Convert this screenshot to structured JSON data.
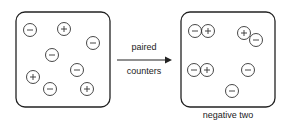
{
  "diagram": {
    "arrow": {
      "label_top": "paired",
      "label_bottom": "counters"
    },
    "left_box": {
      "counters": [
        {
          "sign": "-",
          "x": 30,
          "y": 30
        },
        {
          "sign": "+",
          "x": 64,
          "y": 29
        },
        {
          "sign": "-",
          "x": 93,
          "y": 43
        },
        {
          "sign": "-",
          "x": 52,
          "y": 55
        },
        {
          "sign": "-",
          "x": 77,
          "y": 70
        },
        {
          "sign": "+",
          "x": 33,
          "y": 77
        },
        {
          "sign": "-",
          "x": 50,
          "y": 89
        },
        {
          "sign": "+",
          "x": 87,
          "y": 89
        }
      ]
    },
    "right_box": {
      "caption": "negative two",
      "counters": [
        {
          "sign": "-",
          "x": 195,
          "y": 31
        },
        {
          "sign": "+",
          "x": 208,
          "y": 31
        },
        {
          "sign": "+",
          "x": 244,
          "y": 33
        },
        {
          "sign": "-",
          "x": 256,
          "y": 40
        },
        {
          "sign": "-",
          "x": 194,
          "y": 70
        },
        {
          "sign": "+",
          "x": 207,
          "y": 70
        },
        {
          "sign": "-",
          "x": 248,
          "y": 70
        },
        {
          "sign": "-",
          "x": 232,
          "y": 91
        }
      ]
    }
  }
}
